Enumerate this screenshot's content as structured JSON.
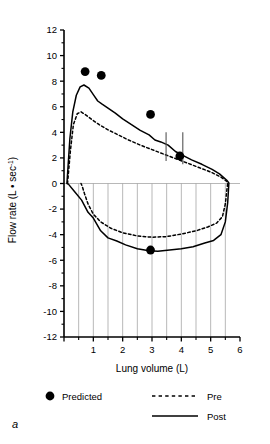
{
  "figure": {
    "panel_label": "a"
  },
  "legend": {
    "items": [
      {
        "label": "Predicted",
        "marker": "filled-circle"
      },
      {
        "label": "Pre",
        "marker": "dashed-line"
      },
      {
        "label": "Post",
        "marker": "solid-line"
      }
    ]
  },
  "chart_data": {
    "type": "line",
    "title": "",
    "xlabel": "Lung volume (L)",
    "ylabel": "Flow rate (L • sec⁻¹)",
    "ylabel_parts": {
      "main": "Flow rate (L • sec",
      "exponent": "-1",
      "close": ")"
    },
    "xlim": [
      0,
      6
    ],
    "ylim": [
      -12,
      12
    ],
    "xticks": [
      0,
      1,
      2,
      3,
      4,
      5,
      6
    ],
    "xtick_labels": [
      "",
      "1",
      "2",
      "3",
      "4",
      "5",
      "6"
    ],
    "xminorticks": [
      0.5,
      1.5,
      2.5,
      3.5,
      4.5,
      5.5
    ],
    "yticks": [
      12,
      10,
      8,
      6,
      4,
      2,
      0,
      -2,
      -4,
      -6,
      -8,
      -10,
      -12
    ],
    "ytick_labels": [
      "12",
      "10",
      "8",
      "6",
      "4",
      "2",
      "0",
      "-2",
      "-4",
      "-6",
      "-8",
      "-10",
      "-12"
    ],
    "grid": "vertical-gridlines-lower-half-only",
    "gridlines_x": [
      0.5,
      1.0,
      1.5,
      2.0,
      2.5,
      3.0,
      3.5,
      4.0,
      4.5,
      5.0,
      5.5
    ],
    "legend_position": "below-axes",
    "series": [
      {
        "name": "Predicted",
        "style": "filled-circle-markers",
        "points": [
          {
            "x": 0.72,
            "y": 8.75
          },
          {
            "x": 1.27,
            "y": 8.45
          },
          {
            "x": 2.95,
            "y": 5.4
          },
          {
            "x": 3.95,
            "y": 2.15
          },
          {
            "x": 2.95,
            "y": -5.2
          }
        ]
      },
      {
        "name": "Pre",
        "style": "dashed",
        "expiratory": [
          {
            "x": 0.12,
            "y": 0.0
          },
          {
            "x": 0.22,
            "y": 2.6
          },
          {
            "x": 0.32,
            "y": 4.6
          },
          {
            "x": 0.45,
            "y": 5.45
          },
          {
            "x": 0.58,
            "y": 5.6
          },
          {
            "x": 0.75,
            "y": 5.35
          },
          {
            "x": 0.95,
            "y": 5.0
          },
          {
            "x": 1.2,
            "y": 4.6
          },
          {
            "x": 1.5,
            "y": 4.2
          },
          {
            "x": 1.85,
            "y": 3.8
          },
          {
            "x": 2.2,
            "y": 3.4
          },
          {
            "x": 2.6,
            "y": 3.0
          },
          {
            "x": 3.0,
            "y": 2.65
          },
          {
            "x": 3.4,
            "y": 2.3
          },
          {
            "x": 3.8,
            "y": 1.95
          },
          {
            "x": 4.2,
            "y": 1.6
          },
          {
            "x": 4.6,
            "y": 1.25
          },
          {
            "x": 5.0,
            "y": 0.9
          },
          {
            "x": 5.35,
            "y": 0.5
          },
          {
            "x": 5.58,
            "y": 0.12
          }
        ],
        "inspiratory": [
          {
            "x": 5.58,
            "y": 0.05
          },
          {
            "x": 5.5,
            "y": -1.6
          },
          {
            "x": 5.4,
            "y": -2.6
          },
          {
            "x": 5.2,
            "y": -3.1
          },
          {
            "x": 4.9,
            "y": -3.4
          },
          {
            "x": 4.5,
            "y": -3.7
          },
          {
            "x": 4.0,
            "y": -3.95
          },
          {
            "x": 3.5,
            "y": -4.15
          },
          {
            "x": 3.0,
            "y": -4.2
          },
          {
            "x": 2.5,
            "y": -4.1
          },
          {
            "x": 2.0,
            "y": -3.85
          },
          {
            "x": 1.6,
            "y": -3.5
          },
          {
            "x": 1.25,
            "y": -3.0
          },
          {
            "x": 1.0,
            "y": -2.4
          },
          {
            "x": 0.82,
            "y": -1.6
          },
          {
            "x": 0.7,
            "y": -0.8
          },
          {
            "x": 0.62,
            "y": -0.2
          },
          {
            "x": 0.58,
            "y": 0.0
          }
        ]
      },
      {
        "name": "Post",
        "style": "solid",
        "expiratory": [
          {
            "x": 0.1,
            "y": 0.0
          },
          {
            "x": 0.2,
            "y": 3.5
          },
          {
            "x": 0.3,
            "y": 5.6
          },
          {
            "x": 0.42,
            "y": 6.9
          },
          {
            "x": 0.55,
            "y": 7.55
          },
          {
            "x": 0.68,
            "y": 7.7
          },
          {
            "x": 0.85,
            "y": 7.45
          },
          {
            "x": 1.0,
            "y": 6.95
          },
          {
            "x": 1.15,
            "y": 6.45
          },
          {
            "x": 1.3,
            "y": 6.2
          },
          {
            "x": 1.5,
            "y": 5.9
          },
          {
            "x": 1.75,
            "y": 5.5
          },
          {
            "x": 2.0,
            "y": 5.05
          },
          {
            "x": 2.3,
            "y": 4.6
          },
          {
            "x": 2.6,
            "y": 4.15
          },
          {
            "x": 2.9,
            "y": 3.8
          },
          {
            "x": 3.1,
            "y": 3.4
          },
          {
            "x": 3.3,
            "y": 3.25
          },
          {
            "x": 3.55,
            "y": 3.0
          },
          {
            "x": 3.8,
            "y": 2.5
          },
          {
            "x": 4.05,
            "y": 2.2
          },
          {
            "x": 4.35,
            "y": 1.85
          },
          {
            "x": 4.7,
            "y": 1.5
          },
          {
            "x": 5.05,
            "y": 1.1
          },
          {
            "x": 5.3,
            "y": 0.75
          },
          {
            "x": 5.55,
            "y": 0.25
          },
          {
            "x": 5.62,
            "y": 0.05
          }
        ],
        "inspiratory": [
          {
            "x": 5.62,
            "y": 0.0
          },
          {
            "x": 5.58,
            "y": -1.5
          },
          {
            "x": 5.5,
            "y": -3.0
          },
          {
            "x": 5.35,
            "y": -4.0
          },
          {
            "x": 5.1,
            "y": -4.45
          },
          {
            "x": 4.8,
            "y": -4.65
          },
          {
            "x": 4.4,
            "y": -4.95
          },
          {
            "x": 4.0,
            "y": -5.1
          },
          {
            "x": 3.6,
            "y": -5.2
          },
          {
            "x": 3.2,
            "y": -5.3
          },
          {
            "x": 2.9,
            "y": -5.25
          },
          {
            "x": 2.5,
            "y": -5.1
          },
          {
            "x": 2.1,
            "y": -4.8
          },
          {
            "x": 1.8,
            "y": -4.5
          },
          {
            "x": 1.5,
            "y": -4.25
          },
          {
            "x": 1.25,
            "y": -3.7
          },
          {
            "x": 1.0,
            "y": -2.7
          },
          {
            "x": 0.82,
            "y": -2.25
          },
          {
            "x": 0.6,
            "y": -1.3
          },
          {
            "x": 0.35,
            "y": -0.6
          },
          {
            "x": 0.15,
            "y": -0.05
          },
          {
            "x": 0.1,
            "y": 0.0
          }
        ]
      }
    ],
    "annotations": [
      {
        "name": "marker-line-1",
        "x": 3.48,
        "y_top": 4.0,
        "y_bottom": 1.75
      },
      {
        "name": "marker-line-2",
        "x": 4.05,
        "y_top": 4.0,
        "y_bottom": 1.5
      }
    ]
  }
}
